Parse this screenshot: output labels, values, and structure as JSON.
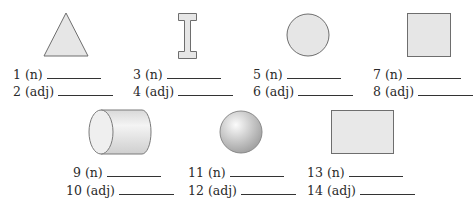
{
  "worksheet": {
    "colors": {
      "shape_fill": "#e6e6e6",
      "shape_stroke": "#6e6e6e",
      "text": "#2a2a2a"
    },
    "shapes": [
      {
        "id": "triangle",
        "name": "triangle"
      },
      {
        "id": "i-beam",
        "name": "i-beam"
      },
      {
        "id": "circle",
        "name": "circle"
      },
      {
        "id": "square",
        "name": "square"
      },
      {
        "id": "cylinder",
        "name": "cylinder"
      },
      {
        "id": "sphere",
        "name": "sphere"
      },
      {
        "id": "rectangle",
        "name": "rectangle"
      }
    ],
    "items": [
      {
        "label": "1 (n)",
        "answer": ""
      },
      {
        "label": "2 (adj)",
        "answer": ""
      },
      {
        "label": "3 (n)",
        "answer": ""
      },
      {
        "label": "4 (adj)",
        "answer": ""
      },
      {
        "label": "5 (n)",
        "answer": ""
      },
      {
        "label": "6 (adj)",
        "answer": ""
      },
      {
        "label": "7 (n)",
        "answer": ""
      },
      {
        "label": "8 (adj)",
        "answer": ""
      },
      {
        "label": "9 (n)",
        "answer": ""
      },
      {
        "label": "10 (adj)",
        "answer": ""
      },
      {
        "label": "11 (n)",
        "answer": ""
      },
      {
        "label": "12 (adj)",
        "answer": ""
      },
      {
        "label": "13 (n)",
        "answer": ""
      },
      {
        "label": "14 (adj)",
        "answer": ""
      }
    ]
  }
}
